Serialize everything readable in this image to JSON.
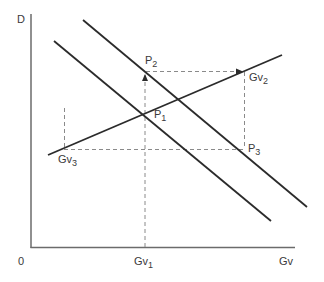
{
  "diagram": {
    "colors": {
      "axis": "#6b6b6b",
      "line": "#2b2b2b",
      "dashed": "#8a8a8a",
      "text": "#3a3a3a"
    },
    "axes": {
      "y_label": "D",
      "x_label": "Gv",
      "origin_label": "0"
    },
    "points": {
      "p1": {
        "base": "P",
        "sub": "1"
      },
      "p2": {
        "base": "P",
        "sub": "2"
      },
      "p3": {
        "base": "P",
        "sub": "3"
      }
    },
    "x_marks": {
      "gv1": {
        "base": "Gv",
        "sub": "1"
      },
      "gv2": {
        "base": "Gv",
        "sub": "2"
      },
      "gv3": {
        "base": "Gv",
        "sub": "3"
      }
    },
    "lines": [
      {
        "name": "demand-curve-upper",
        "x1": 83,
        "y1": 20,
        "x2": 307,
        "y2": 207
      },
      {
        "name": "demand-curve-lower",
        "x1": 54,
        "y1": 41,
        "x2": 271,
        "y2": 221
      },
      {
        "name": "supply-curve-upward",
        "x1": 48,
        "y1": 155,
        "x2": 282,
        "y2": 55
      }
    ]
  }
}
